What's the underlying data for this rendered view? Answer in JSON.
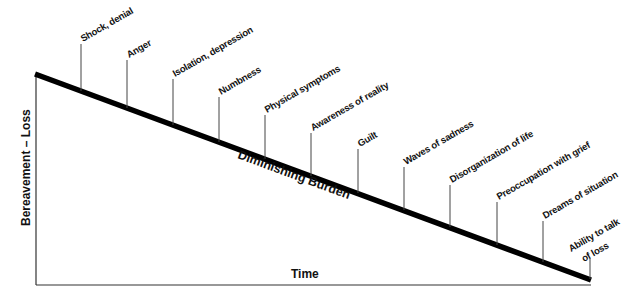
{
  "diagram": {
    "y_axis_label": "Bereavement  –  Loss",
    "x_axis_label": "Time",
    "trend_label": "Diminishing Burden",
    "stages": [
      {
        "label": "Shock, denial"
      },
      {
        "label": "Anger"
      },
      {
        "label": "Isolation, depression"
      },
      {
        "label": "Numbness"
      },
      {
        "label": "Physical symptoms"
      },
      {
        "label": "Awareness of reality"
      },
      {
        "label": "Guilt"
      },
      {
        "label": "Waves of sadness"
      },
      {
        "label": "Disorganization of life"
      },
      {
        "label": "Preoccupation with grief"
      },
      {
        "label": "Dreams of situation"
      },
      {
        "label": "Ability to talk",
        "label_line2": "of loss"
      }
    ],
    "colors": {
      "line": "#000000",
      "axis": "#333333",
      "text": "#111111",
      "background": "#ffffff"
    }
  }
}
